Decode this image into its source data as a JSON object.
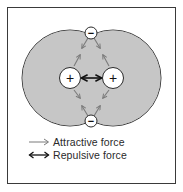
{
  "diagram": {
    "colors": {
      "frame": "#3a3a3a",
      "cloud_fill": "#c6c6c6",
      "cloud_stroke": "#3c3c3c",
      "particle_fill": "#ffffff",
      "attractive_arrow": "#7a7a7a",
      "repulsive_arrow": "#111111"
    },
    "nuclei": [
      {
        "symbol": "+",
        "label": "nucleus-left"
      },
      {
        "symbol": "+",
        "label": "nucleus-right"
      }
    ],
    "electrons": [
      {
        "symbol": "−",
        "label": "electron-top"
      },
      {
        "symbol": "−",
        "label": "electron-bottom"
      }
    ],
    "nodes_text": {
      "nucleus_left": "+",
      "nucleus_right": "+",
      "electron_top": "−",
      "electron_bottom": "−"
    }
  },
  "legend": {
    "items": [
      {
        "icon": "gray-right-arrow-icon",
        "label": "Attractive force"
      },
      {
        "icon": "black-double-arrow-icon",
        "label": "Repulsive force"
      }
    ]
  }
}
